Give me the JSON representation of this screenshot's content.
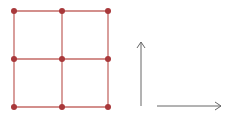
{
  "diagram": {
    "type": "grid-with-axes",
    "grid": {
      "columns": 2,
      "rows": 2,
      "xs": [
        14,
        62,
        108
      ],
      "ys": [
        11,
        59,
        107
      ],
      "line_color": "#c46a66",
      "node_color": "#a8383a",
      "node_radius": 3
    },
    "axes": {
      "vertical_arrow": {
        "x": 141,
        "y1": 106,
        "y2": 42,
        "direction": "up"
      },
      "horizontal_arrow": {
        "y": 106,
        "x1": 157,
        "x2": 221,
        "direction": "right"
      },
      "color": "#666666"
    }
  }
}
